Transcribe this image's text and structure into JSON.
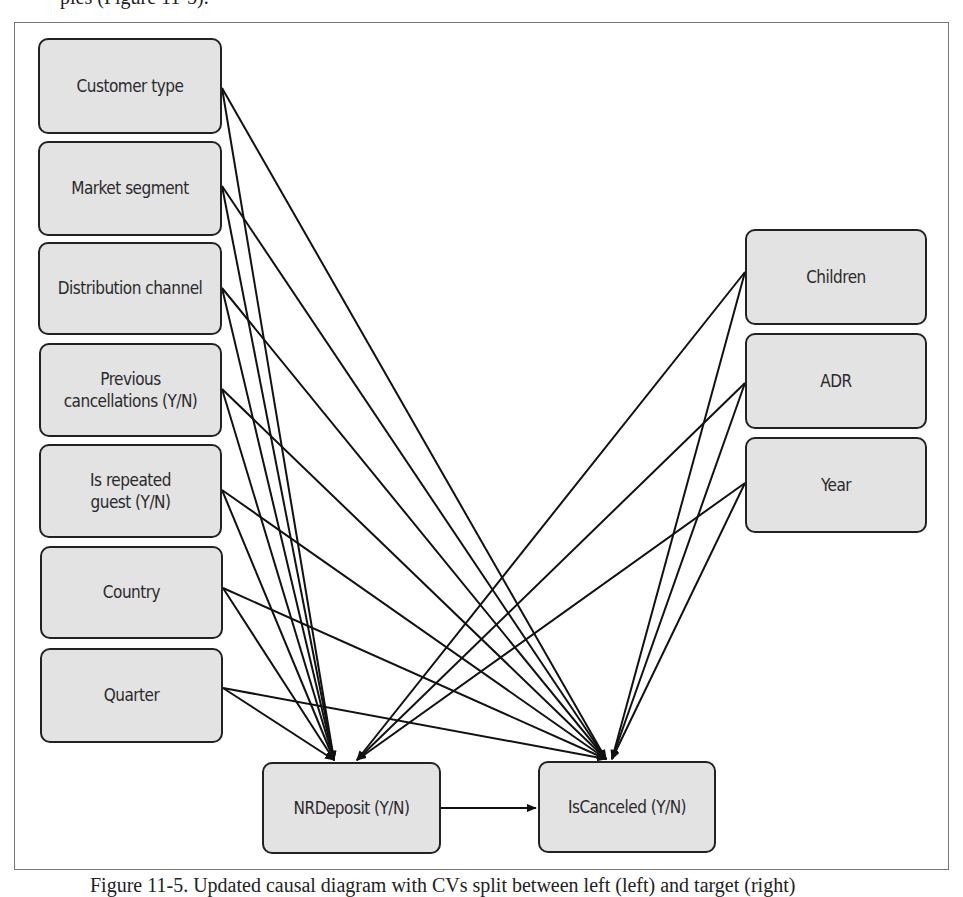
{
  "top_text": "ples (Figure 11-5).",
  "caption": "Figure 11-5. Updated causal diagram with CVs split between left (left) and target (right)",
  "colors": {
    "node_fill": "#e3e3e3",
    "node_border": "#222222",
    "edge": "#111111",
    "frame": "#777777"
  },
  "nodes": {
    "customer_type": {
      "label": "Customer type",
      "x": 38,
      "y": 38,
      "w": 184,
      "h": 96
    },
    "market_segment": {
      "label": "Market segment",
      "x": 38,
      "y": 141,
      "w": 184,
      "h": 95
    },
    "distribution_channel": {
      "label": "Distribution channel",
      "x": 38,
      "y": 242,
      "w": 184,
      "h": 93
    },
    "previous_cancellations": {
      "label": "Previous cancellations (Y/N)",
      "x": 39,
      "y": 343,
      "w": 183,
      "h": 94
    },
    "is_repeated_guest": {
      "label": "Is repeated guest (Y/N)",
      "x": 39,
      "y": 444,
      "w": 183,
      "h": 94
    },
    "country": {
      "label": "Country",
      "x": 40,
      "y": 546,
      "w": 183,
      "h": 93
    },
    "quarter": {
      "label": "Quarter",
      "x": 40,
      "y": 648,
      "w": 183,
      "h": 95
    },
    "children": {
      "label": "Children",
      "x": 745,
      "y": 229,
      "w": 182,
      "h": 96
    },
    "adr": {
      "label": "ADR",
      "x": 745,
      "y": 333,
      "w": 182,
      "h": 96
    },
    "year": {
      "label": "Year",
      "x": 745,
      "y": 437,
      "w": 182,
      "h": 96
    },
    "nrdeposit": {
      "label": "NRDeposit (Y/N)",
      "x": 262,
      "y": 762,
      "w": 179,
      "h": 92
    },
    "iscanceled": {
      "label": "IsCanceled (Y/N)",
      "x": 538,
      "y": 761,
      "w": 178,
      "h": 92
    }
  },
  "edges": [
    {
      "from": "customer_type",
      "to": "nrdeposit",
      "x1": 222,
      "y1": 88,
      "x2": 334,
      "y2": 760
    },
    {
      "from": "customer_type",
      "to": "iscanceled",
      "x1": 222,
      "y1": 88,
      "x2": 606,
      "y2": 759
    },
    {
      "from": "market_segment",
      "to": "nrdeposit",
      "x1": 222,
      "y1": 186,
      "x2": 334,
      "y2": 760
    },
    {
      "from": "market_segment",
      "to": "iscanceled",
      "x1": 222,
      "y1": 186,
      "x2": 606,
      "y2": 759
    },
    {
      "from": "distribution_channel",
      "to": "nrdeposit",
      "x1": 222,
      "y1": 288,
      "x2": 334,
      "y2": 760
    },
    {
      "from": "distribution_channel",
      "to": "iscanceled",
      "x1": 222,
      "y1": 288,
      "x2": 606,
      "y2": 759
    },
    {
      "from": "previous_cancellations",
      "to": "nrdeposit",
      "x1": 222,
      "y1": 389,
      "x2": 334,
      "y2": 760
    },
    {
      "from": "previous_cancellations",
      "to": "iscanceled",
      "x1": 222,
      "y1": 389,
      "x2": 606,
      "y2": 759
    },
    {
      "from": "is_repeated_guest",
      "to": "nrdeposit",
      "x1": 222,
      "y1": 490,
      "x2": 334,
      "y2": 760
    },
    {
      "from": "is_repeated_guest",
      "to": "iscanceled",
      "x1": 222,
      "y1": 490,
      "x2": 606,
      "y2": 759
    },
    {
      "from": "country",
      "to": "nrdeposit",
      "x1": 223,
      "y1": 588,
      "x2": 334,
      "y2": 760
    },
    {
      "from": "country",
      "to": "iscanceled",
      "x1": 223,
      "y1": 588,
      "x2": 606,
      "y2": 759
    },
    {
      "from": "quarter",
      "to": "nrdeposit",
      "x1": 223,
      "y1": 688,
      "x2": 334,
      "y2": 760
    },
    {
      "from": "quarter",
      "to": "iscanceled",
      "x1": 223,
      "y1": 688,
      "x2": 606,
      "y2": 759
    },
    {
      "from": "children",
      "to": "nrdeposit",
      "x1": 745,
      "y1": 272,
      "x2": 357,
      "y2": 760
    },
    {
      "from": "children",
      "to": "iscanceled",
      "x1": 745,
      "y1": 272,
      "x2": 612,
      "y2": 759
    },
    {
      "from": "adr",
      "to": "nrdeposit",
      "x1": 745,
      "y1": 383,
      "x2": 357,
      "y2": 760
    },
    {
      "from": "adr",
      "to": "iscanceled",
      "x1": 745,
      "y1": 383,
      "x2": 612,
      "y2": 759
    },
    {
      "from": "year",
      "to": "nrdeposit",
      "x1": 745,
      "y1": 483,
      "x2": 357,
      "y2": 760
    },
    {
      "from": "year",
      "to": "iscanceled",
      "x1": 745,
      "y1": 483,
      "x2": 612,
      "y2": 759
    },
    {
      "from": "nrdeposit",
      "to": "iscanceled",
      "x1": 441,
      "y1": 808,
      "x2": 536,
      "y2": 808
    }
  ]
}
